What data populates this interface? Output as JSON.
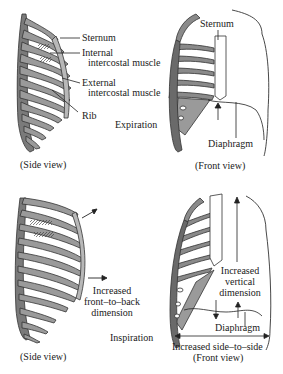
{
  "expiration": {
    "state_label": "Expiration",
    "side_view": {
      "caption": "(Side view)",
      "labels": {
        "sternum": "Sternum",
        "internal_line1": "Internal",
        "internal_line2": "intercostal muscle",
        "external_line1": "External",
        "external_line2": "intercostal muscle",
        "rib": "Rib"
      }
    },
    "front_view": {
      "caption": "(Front view)",
      "labels": {
        "sternum": "Sternum",
        "diaphragm": "Diaphragm"
      }
    }
  },
  "inspiration": {
    "state_label": "Inspiration",
    "side_view": {
      "caption": "(Side view)",
      "labels": {
        "front_back_line1": "Increased",
        "front_back_line2": "front–to–back",
        "front_back_line3": "dimension"
      }
    },
    "front_view": {
      "caption": "(Front view)",
      "labels": {
        "vertical_line1": "Increased",
        "vertical_line2": "vertical",
        "vertical_line3": "dimension",
        "diaphragm": "Diaphragm",
        "side_to_side": "Increased side–to–side"
      }
    }
  },
  "colors": {
    "ink": "#1a1a1a",
    "rib_fill": "#9a9a9a",
    "rib_dark": "#5a5a5a",
    "background": "#ffffff"
  }
}
